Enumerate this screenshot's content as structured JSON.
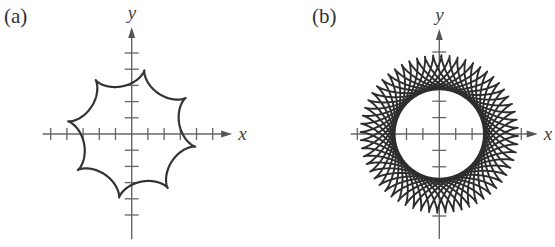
{
  "figures": [
    {
      "id": "a",
      "label": "(a)",
      "x_axis_label": "x",
      "y_axis_label": "y",
      "curve": {
        "type": "hypocycloid",
        "description": "8-cusped hypocycloid",
        "R": 4,
        "r": 0.5,
        "cusps": 8,
        "t_max_turns": 1
      },
      "layout": {
        "origin": [
          131.7,
          134
        ],
        "unit_px": 16.2,
        "x_ticks": [
          -5,
          -4,
          -3,
          -2,
          -1,
          1,
          2,
          3,
          4,
          5
        ],
        "y_ticks": [
          -5,
          -4,
          -3,
          -2,
          -1,
          1,
          2,
          3,
          4,
          5
        ],
        "x_axis_range": [
          -5.5,
          6.2
        ],
        "y_axis_range": [
          -6.5,
          6.6
        ],
        "label_pos": [
          4,
          26
        ],
        "stroke_color": "#333333",
        "axis_color": "#666666"
      }
    },
    {
      "id": "b",
      "label": "(b)",
      "x_axis_label": "x",
      "y_axis_label": "y",
      "curve": {
        "type": "hypocycloid",
        "description": "hypocycloid with non-integer radius ratio, many overlapping loops",
        "R": 4.8,
        "r": 1.04,
        "cusps": "many",
        "t_max_turns": 26
      },
      "layout": {
        "origin": [
          439.3,
          134
        ],
        "unit_px": 16.4,
        "x_ticks": [
          -5,
          -3,
          -2,
          -1,
          1,
          2,
          3,
          5
        ],
        "y_ticks": [
          -5,
          -3,
          -2,
          -1,
          1,
          2,
          3,
          5
        ],
        "x_axis_range": [
          -5.4,
          6.0
        ],
        "y_axis_range": [
          -6.4,
          6.4
        ],
        "label_pos": [
          312,
          26
        ],
        "stroke_color": "#2d2d2d",
        "axis_color": "#666666"
      }
    }
  ]
}
